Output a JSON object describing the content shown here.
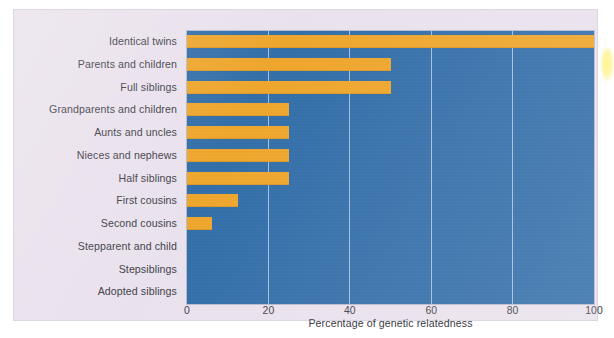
{
  "chart_data": {
    "type": "bar",
    "orientation": "horizontal",
    "title": "",
    "xlabel": "Percentage of genetic relatedness",
    "ylabel": "",
    "xlim": [
      0,
      100
    ],
    "xticks": [
      0,
      20,
      40,
      60,
      80,
      100
    ],
    "xtick_labels": [
      "0",
      "20",
      "40",
      "60",
      "80",
      "100"
    ],
    "grid": true,
    "legend": "none",
    "categories": [
      "Identical twins",
      "Parents and children",
      "Full siblings",
      "Grandparents and children",
      "Aunts and uncles",
      "Nieces and nephews",
      "Half siblings",
      "First cousins",
      "Second cousins",
      "Stepparent and child",
      "Stepsiblings",
      "Adopted siblings"
    ],
    "values": [
      100,
      50,
      50,
      25,
      25,
      25,
      25,
      12.5,
      6.25,
      0,
      0,
      0
    ],
    "colors": {
      "bar": "#efa528",
      "plot_background": "#2f6ca8",
      "gridline": "#b9cbe0",
      "card_background": "#e9e1ec",
      "text": "#3b3b46"
    }
  }
}
